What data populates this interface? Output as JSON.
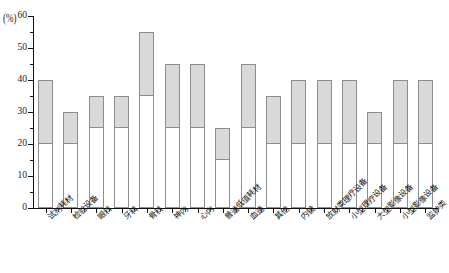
{
  "chart_data": {
    "type": "bar",
    "title": "",
    "subtitle": "",
    "xlabel": "",
    "ylabel": "",
    "y_unit_label": "(%)",
    "ylim": [
      0,
      60
    ],
    "yticks": [
      0,
      10,
      20,
      30,
      40,
      50,
      60
    ],
    "ytick_labels": [
      "0",
      "10",
      "20",
      "30",
      "40",
      "50",
      "60"
    ],
    "grid": false,
    "legend": "none",
    "stacked": true,
    "categories": [
      "试剂耗材",
      "检验设备",
      "眼科",
      "牙科",
      "骨科",
      "神内",
      "心内",
      "普通低值耗材",
      "血透",
      "其他",
      "内镜",
      "放射类理疗设备",
      "小型理疗设备",
      "大型影像设备",
      "小型影像设备",
      "监护类"
    ],
    "series": [
      {
        "name": "lower",
        "color": "#ffffff",
        "values": [
          20,
          20,
          25,
          25,
          35,
          25,
          25,
          15,
          25,
          20,
          20,
          20,
          20,
          20,
          20,
          20
        ]
      },
      {
        "name": "upper",
        "color": "#d9d9d9",
        "values": [
          20,
          10,
          10,
          10,
          20,
          20,
          20,
          10,
          20,
          15,
          20,
          20,
          20,
          10,
          20,
          20
        ]
      }
    ],
    "totals": [
      40,
      30,
      35,
      35,
      55,
      45,
      45,
      25,
      45,
      35,
      40,
      40,
      40,
      30,
      40,
      40
    ],
    "segment_bounds": [
      [
        20,
        40
      ],
      [
        20,
        30
      ],
      [
        25,
        35
      ],
      [
        25,
        35
      ],
      [
        35,
        55
      ],
      [
        25,
        45
      ],
      [
        25,
        45
      ],
      [
        15,
        25
      ],
      [
        25,
        45
      ],
      [
        20,
        35
      ],
      [
        20,
        40
      ],
      [
        20,
        40
      ],
      [
        20,
        40
      ],
      [
        20,
        30
      ],
      [
        20,
        40
      ],
      [
        20,
        40
      ]
    ],
    "axis_color": "#111111",
    "bar_border_color": "#8d8d8d"
  }
}
